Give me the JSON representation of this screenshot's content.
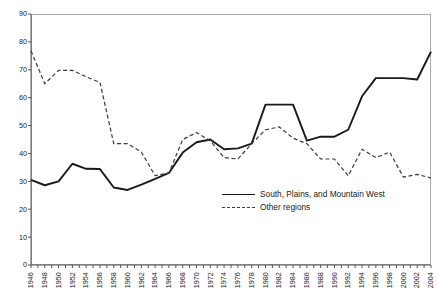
{
  "chart_data": {
    "type": "line",
    "title": "",
    "subtitle": "",
    "xlabel": "",
    "ylabel": "",
    "xlim": [
      1946,
      2004
    ],
    "ylim": [
      0,
      90
    ],
    "grid": false,
    "legend_position": "inside-center-right",
    "y_ticks": [
      0,
      10,
      20,
      30,
      40,
      50,
      60,
      70,
      80,
      90
    ],
    "x_tick_labels": [
      "1946",
      "1948",
      "1950",
      "1952",
      "1954",
      "1956",
      "1958",
      "1960",
      "1962",
      "1964",
      "1966",
      "1968",
      "1970",
      "1972",
      "1974",
      "1976",
      "1978",
      "1980",
      "1982",
      "1984",
      "1986",
      "1988",
      "1990",
      "1992",
      "1994",
      "1996",
      "1998",
      "2000",
      "2002",
      "2004"
    ],
    "x": [
      1946,
      1948,
      1950,
      1952,
      1954,
      1956,
      1958,
      1960,
      1962,
      1964,
      1966,
      1968,
      1970,
      1972,
      1974,
      1976,
      1978,
      1980,
      1982,
      1984,
      1986,
      1988,
      1990,
      1992,
      1994,
      1996,
      1998,
      2000,
      2002,
      2004
    ],
    "series": [
      {
        "name": "South, Plains, and Mountain West",
        "style": "solid",
        "color": "#1a1a1a",
        "values": [
          30.5,
          28.6,
          30.0,
          36.3,
          34.5,
          34.4,
          27.8,
          26.9,
          28.8,
          30.9,
          33.0,
          40.3,
          44.0,
          45.0,
          41.5,
          41.8,
          43.5,
          57.5,
          57.5,
          57.5,
          44.6,
          46.0,
          46.0,
          48.5,
          60.5,
          67.0,
          67.0,
          67.0,
          66.5,
          76.5
        ]
      },
      {
        "name": "Other regions",
        "style": "dashed",
        "color": "#3a3a3a",
        "values": [
          76.8,
          65.0,
          69.8,
          69.8,
          67.5,
          65.5,
          43.5,
          43.5,
          40.5,
          32.0,
          33.0,
          45.0,
          47.5,
          44.5,
          38.5,
          38.0,
          43.5,
          48.5,
          49.5,
          45.5,
          43.5,
          38.0,
          38.0,
          32.0,
          41.5,
          38.5,
          40.5,
          31.5,
          32.5,
          31.2
        ]
      }
    ]
  },
  "legend": {
    "items": [
      {
        "label": "South, Plains, and Mountain West",
        "style": "solid"
      },
      {
        "label": "Other regions",
        "style": "dashed"
      }
    ]
  }
}
